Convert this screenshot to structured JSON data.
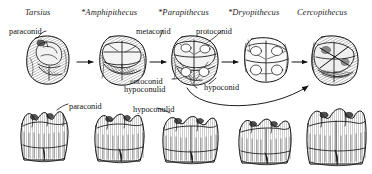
{
  "figure": {
    "title_row": {
      "genera": [
        {
          "id": "tarsius",
          "label": "Tarsius",
          "extinct": false,
          "x": 25,
          "y": 7
        },
        {
          "id": "amphipithecus",
          "label": "*Amphipithecus",
          "extinct": true,
          "x": 81,
          "y": 7
        },
        {
          "id": "parapithecus",
          "label": "*Parapithecus",
          "extinct": true,
          "x": 158,
          "y": 7
        },
        {
          "id": "dryopithecus",
          "label": "*Dryopithecus",
          "extinct": true,
          "x": 228,
          "y": 7
        },
        {
          "id": "cercopithecus",
          "label": "Cercopithecus",
          "extinct": false,
          "x": 297,
          "y": 7
        }
      ]
    },
    "occlusal_labels": [
      {
        "id": "paraconid-upper",
        "label": "paraconid",
        "x": 9,
        "y": 27
      },
      {
        "id": "metaconid",
        "label": "metaconid",
        "x": 136,
        "y": 27
      },
      {
        "id": "protoconid",
        "label": "protoconid",
        "x": 196,
        "y": 27
      },
      {
        "id": "entoconid",
        "label": "entoconid",
        "x": 130,
        "y": 77
      },
      {
        "id": "hypoconulid-upper",
        "label": "hypoconulid",
        "x": 124,
        "y": 85
      },
      {
        "id": "hypoconid",
        "label": "hypoconid",
        "x": 204,
        "y": 83
      }
    ],
    "lateral_labels": [
      {
        "id": "paraconid-lower",
        "label": "paraconid",
        "x": 69,
        "y": 102
      },
      {
        "id": "hypoconulid-lower",
        "label": "hypoconulid",
        "x": 133,
        "y": 105
      }
    ],
    "occlusal_teeth": [
      {
        "id": "crown-tarsius",
        "x": 27,
        "y": 37,
        "w": 44,
        "h": 46
      },
      {
        "id": "crown-amphipithecus",
        "x": 100,
        "y": 37,
        "w": 46,
        "h": 46
      },
      {
        "id": "crown-parapithecus",
        "x": 172,
        "y": 37,
        "w": 46,
        "h": 46
      },
      {
        "id": "crown-dryopithecus",
        "x": 244,
        "y": 39,
        "w": 44,
        "h": 42
      },
      {
        "id": "crown-cercopithecus",
        "x": 312,
        "y": 37,
        "w": 44,
        "h": 46
      }
    ],
    "arrows": [
      {
        "id": "arrow-1",
        "x1": 76,
        "y1": 62,
        "x2": 95,
        "y2": 62
      },
      {
        "id": "arrow-2",
        "x1": 150,
        "y1": 62,
        "x2": 168,
        "y2": 62
      },
      {
        "id": "arrow-3",
        "x1": 222,
        "y1": 62,
        "x2": 240,
        "y2": 62
      },
      {
        "id": "arrow-4",
        "x1": 292,
        "y1": 62,
        "x2": 308,
        "y2": 62
      }
    ],
    "curved_arrow": {
      "id": "curved-arrow-parapithecus-to-cercopithecus",
      "path": "M 188 86 C 206 110, 268 110, 310 88"
    },
    "lateral_teeth": [
      {
        "id": "side-tarsius",
        "x": 18,
        "y": 108,
        "w": 54,
        "h": 58
      },
      {
        "id": "side-amphipithecus",
        "x": 94,
        "y": 110,
        "w": 52,
        "h": 56
      },
      {
        "id": "side-parapithecus",
        "x": 162,
        "y": 112,
        "w": 54,
        "h": 54
      },
      {
        "id": "side-dryopithecus",
        "x": 238,
        "y": 114,
        "w": 52,
        "h": 52
      },
      {
        "id": "side-cercopithecus",
        "x": 305,
        "y": 108,
        "w": 56,
        "h": 58
      }
    ]
  },
  "colors": {
    "ink": "#1a1a1a",
    "background": "#ffffff",
    "shading": "#4a4a4a",
    "light_shading": "#8c8c8c"
  }
}
